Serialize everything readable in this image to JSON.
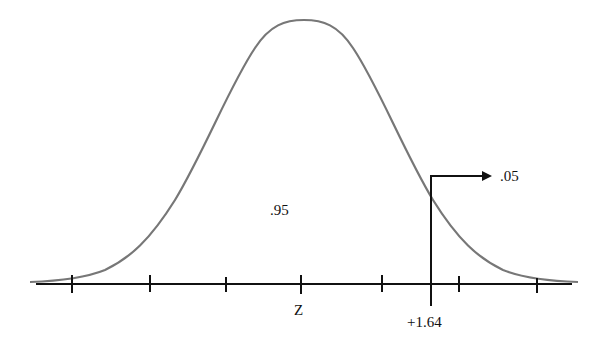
{
  "diagram": {
    "curve_color": "#777777",
    "axis_color": "#111111",
    "labels": {
      "center_area": ".95",
      "tail_area": ".05",
      "axis_label": "Z",
      "critical_value": "+1.64"
    },
    "ticks_x": [
      72,
      150,
      226,
      301,
      382,
      459,
      537
    ],
    "critical_x": 431
  }
}
